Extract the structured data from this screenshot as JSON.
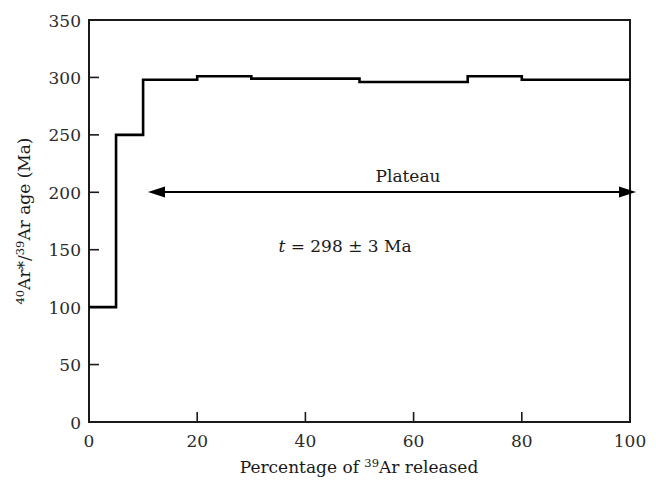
{
  "chart_data": {
    "type": "line",
    "subtype": "step-histogram",
    "title": "",
    "xlabel": "Percentage of 39Ar released",
    "xlabel_parts": {
      "pre": "Percentage of ",
      "sup": "39",
      "post": "Ar released"
    },
    "ylabel": "40Ar*/39Ar age (Ma)",
    "ylabel_parts": {
      "sup1": "40",
      "mid1": "Ar*/",
      "sup2": "39",
      "post": "Ar age (Ma)"
    },
    "xlim": [
      0,
      100
    ],
    "ylim": [
      0,
      350
    ],
    "xticks": [
      0,
      20,
      40,
      60,
      80,
      100
    ],
    "yticks": [
      0,
      50,
      100,
      150,
      200,
      250,
      300,
      350
    ],
    "xtick_labels": [
      "0",
      "20",
      "40",
      "60",
      "80",
      "100"
    ],
    "ytick_labels": [
      "0",
      "50",
      "100",
      "150",
      "200",
      "250",
      "300",
      "350"
    ],
    "grid": false,
    "legend": null,
    "line_color": "#000000",
    "steps": [
      {
        "x_start": 0,
        "x_end": 5,
        "value": 100
      },
      {
        "x_start": 5,
        "x_end": 10,
        "value": 250
      },
      {
        "x_start": 10,
        "x_end": 20,
        "value": 298
      },
      {
        "x_start": 20,
        "x_end": 30,
        "value": 301
      },
      {
        "x_start": 30,
        "x_end": 50,
        "value": 299
      },
      {
        "x_start": 50,
        "x_end": 70,
        "value": 296
      },
      {
        "x_start": 70,
        "x_end": 80,
        "value": 301
      },
      {
        "x_start": 80,
        "x_end": 100,
        "value": 298
      }
    ],
    "annotations": [
      {
        "name": "plateau-label",
        "text": "Plateau",
        "x": 58,
        "y": 215
      },
      {
        "name": "age-label",
        "text": "t = 298 ± 3 Ma",
        "parts": {
          "ital": "t",
          "rest": " = 298 ± 3 Ma"
        },
        "x": 58,
        "y": 163
      },
      {
        "name": "plateau-arrow",
        "type": "double-arrow",
        "x_start": 12,
        "x_end": 99.5,
        "y": 192
      }
    ]
  },
  "axes": {
    "frame_color": "#1a1a1a",
    "tick_color": "#1a1a1a"
  }
}
